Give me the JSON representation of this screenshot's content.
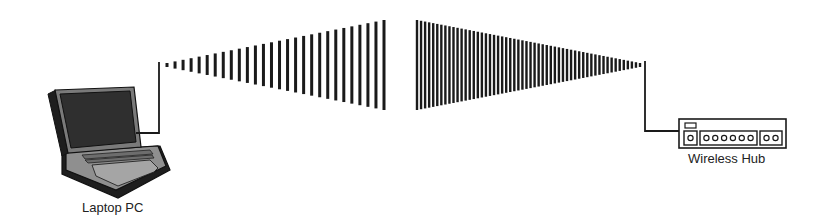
{
  "diagram": {
    "type": "wireless-network-diagram",
    "nodes": [
      {
        "id": "laptop",
        "label": "Laptop PC",
        "icon": "laptop-icon"
      },
      {
        "id": "hub",
        "label": "Wireless Hub",
        "icon": "wireless-hub-icon"
      }
    ],
    "edges": [
      {
        "from": "laptop",
        "to": "hub",
        "style": "wireless-signal"
      }
    ],
    "signal": {
      "left_bars": {
        "count": 28,
        "x_start": 167,
        "x_end": 384,
        "min_height": 4,
        "max_height": 90,
        "bar_width": 3
      },
      "right_bars": {
        "count": 56,
        "x_start": 417,
        "x_end": 640,
        "min_height": 4,
        "max_height": 90,
        "bar_width": 2.4
      },
      "center_y": 65
    },
    "hub_ports": {
      "main": 1,
      "group_a": 6,
      "group_b": 2
    },
    "colors": {
      "line": "#1a1a1a",
      "laptop_fill": "#8a8a8a",
      "laptop_dark": "#2a2a2a",
      "screen": "#3a3a3a"
    }
  }
}
